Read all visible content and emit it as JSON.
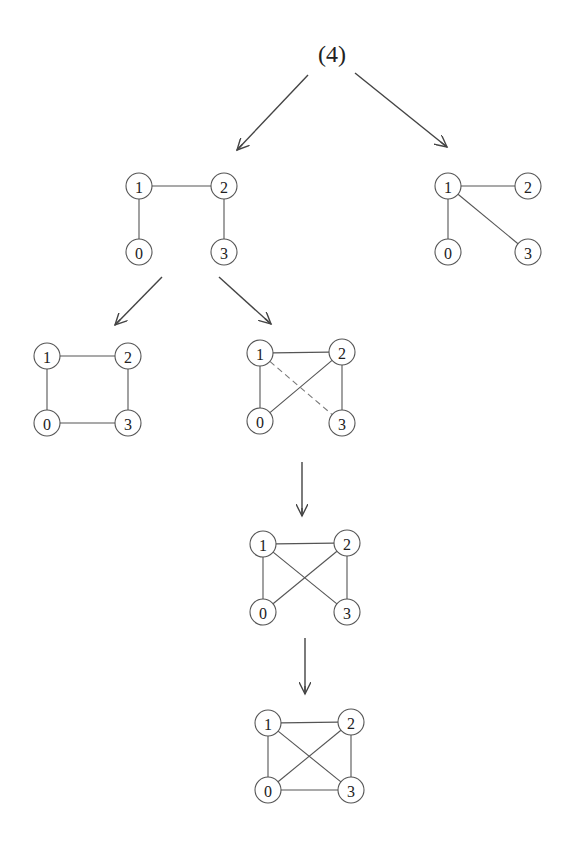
{
  "root": {
    "label": "(4)",
    "x": 332,
    "y": 54
  },
  "node_radius": 13,
  "graphs": [
    {
      "id": "A",
      "nodes": [
        {
          "id": "1",
          "x": 139,
          "y": 186
        },
        {
          "id": "2",
          "x": 224,
          "y": 186
        },
        {
          "id": "0",
          "x": 139,
          "y": 252
        },
        {
          "id": "3",
          "x": 224,
          "y": 252
        }
      ],
      "edges": [
        [
          "1",
          "2",
          "solid"
        ],
        [
          "1",
          "0",
          "solid"
        ],
        [
          "2",
          "3",
          "solid"
        ]
      ]
    },
    {
      "id": "B",
      "nodes": [
        {
          "id": "1",
          "x": 448,
          "y": 186
        },
        {
          "id": "2",
          "x": 528,
          "y": 186
        },
        {
          "id": "0",
          "x": 448,
          "y": 252
        },
        {
          "id": "3",
          "x": 528,
          "y": 252
        }
      ],
      "edges": [
        [
          "1",
          "2",
          "solid"
        ],
        [
          "1",
          "0",
          "solid"
        ],
        [
          "1",
          "3",
          "solid"
        ]
      ]
    },
    {
      "id": "C",
      "nodes": [
        {
          "id": "1",
          "x": 47,
          "y": 356
        },
        {
          "id": "2",
          "x": 128,
          "y": 356
        },
        {
          "id": "0",
          "x": 47,
          "y": 423
        },
        {
          "id": "3",
          "x": 128,
          "y": 423
        }
      ],
      "edges": [
        [
          "1",
          "2",
          "solid"
        ],
        [
          "1",
          "0",
          "solid"
        ],
        [
          "2",
          "3",
          "solid"
        ],
        [
          "0",
          "3",
          "solid"
        ]
      ]
    },
    {
      "id": "D",
      "nodes": [
        {
          "id": "1",
          "x": 260,
          "y": 353
        },
        {
          "id": "2",
          "x": 342,
          "y": 352
        },
        {
          "id": "0",
          "x": 260,
          "y": 421
        },
        {
          "id": "3",
          "x": 342,
          "y": 423
        }
      ],
      "edges": [
        [
          "1",
          "2",
          "solid"
        ],
        [
          "1",
          "0",
          "solid"
        ],
        [
          "2",
          "3",
          "solid"
        ],
        [
          "0",
          "2",
          "solid"
        ],
        [
          "1",
          "3",
          "dashed"
        ]
      ]
    },
    {
      "id": "E",
      "nodes": [
        {
          "id": "1",
          "x": 263,
          "y": 544
        },
        {
          "id": "2",
          "x": 347,
          "y": 543
        },
        {
          "id": "0",
          "x": 263,
          "y": 612
        },
        {
          "id": "3",
          "x": 347,
          "y": 612
        }
      ],
      "edges": [
        [
          "1",
          "2",
          "solid"
        ],
        [
          "1",
          "0",
          "solid"
        ],
        [
          "2",
          "3",
          "solid"
        ],
        [
          "0",
          "2",
          "solid"
        ],
        [
          "1",
          "3",
          "solid"
        ]
      ]
    },
    {
      "id": "F",
      "nodes": [
        {
          "id": "1",
          "x": 268,
          "y": 723
        },
        {
          "id": "2",
          "x": 351,
          "y": 722
        },
        {
          "id": "0",
          "x": 268,
          "y": 790
        },
        {
          "id": "3",
          "x": 351,
          "y": 790
        }
      ],
      "edges": [
        [
          "1",
          "2",
          "solid"
        ],
        [
          "1",
          "0",
          "solid"
        ],
        [
          "2",
          "3",
          "solid"
        ],
        [
          "0",
          "2",
          "solid"
        ],
        [
          "1",
          "3",
          "solid"
        ],
        [
          "0",
          "3",
          "solid"
        ]
      ]
    }
  ],
  "arrows": [
    {
      "from": [
        308,
        75
      ],
      "to": [
        237,
        150
      ]
    },
    {
      "from": [
        355,
        73
      ],
      "to": [
        447,
        147
      ]
    },
    {
      "from": [
        162,
        277
      ],
      "to": [
        115,
        325
      ]
    },
    {
      "from": [
        219,
        277
      ],
      "to": [
        271,
        324
      ]
    },
    {
      "from": [
        302,
        462
      ],
      "to": [
        302,
        516
      ]
    },
    {
      "from": [
        305,
        638
      ],
      "to": [
        305,
        694
      ]
    }
  ]
}
